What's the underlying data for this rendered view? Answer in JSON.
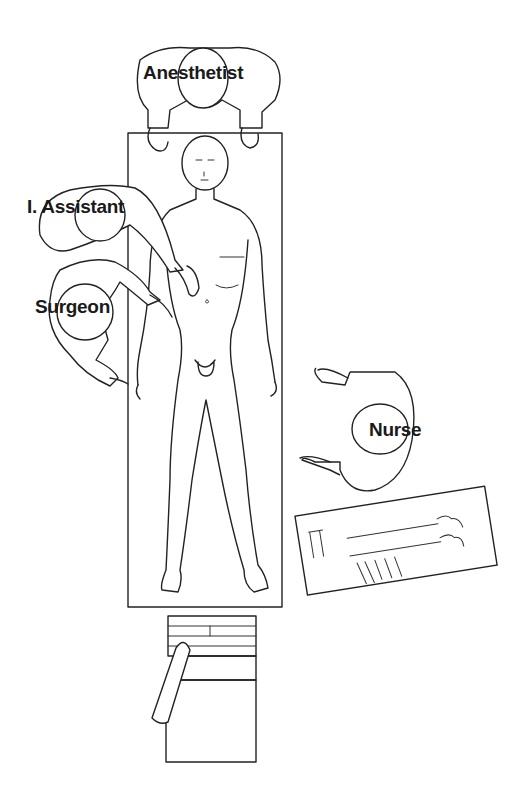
{
  "diagram": {
    "type": "operating-room-layout",
    "labels": {
      "anesthetist": "Anesthetist",
      "assistant": "I. Assistant",
      "surgeon": "Surgeon",
      "nurse": "Nurse"
    },
    "elements": [
      {
        "id": "operating-table",
        "kind": "table"
      },
      {
        "id": "patient",
        "kind": "supine-figure"
      },
      {
        "id": "anesthetist",
        "kind": "staff",
        "position": "head"
      },
      {
        "id": "assistant",
        "kind": "staff",
        "position": "left-upper"
      },
      {
        "id": "surgeon",
        "kind": "staff",
        "position": "left-lower"
      },
      {
        "id": "nurse",
        "kind": "staff",
        "position": "right"
      },
      {
        "id": "instrument-tray",
        "kind": "tray"
      },
      {
        "id": "laparoscopy-tower",
        "kind": "equipment",
        "position": "foot"
      }
    ],
    "colors": {
      "line": "#222222",
      "background": "#ffffff",
      "text": "#1a1a1a"
    }
  }
}
